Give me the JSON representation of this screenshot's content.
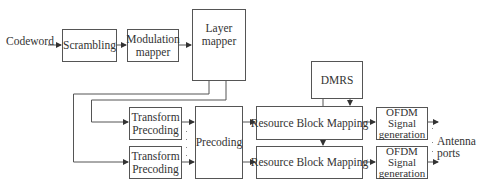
{
  "diagram": {
    "input_label": "Codeword",
    "blocks": {
      "scrambling": "Scrambling",
      "modulation_mapper": "Modulation mapper",
      "layer_mapper": "Layer mapper",
      "transform_precoding_1": "Transform Precoding",
      "transform_precoding_2": "Transform Precoding",
      "precoding": "Precoding",
      "dmrs": "DMRS",
      "resource_block_mapping_1": "Resource Block Mapping",
      "resource_block_mapping_2": "Resource Block Mapping",
      "ofdm_1": "OFDM Signal generation",
      "ofdm_2": "OFDM Signal generation"
    },
    "output_label_1": "Antenna",
    "output_label_2": "ports",
    "colors": {
      "line": "#555555",
      "text": "#333333",
      "background": "#ffffff"
    }
  }
}
